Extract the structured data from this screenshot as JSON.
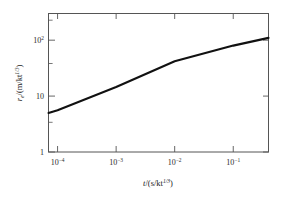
{
  "chart_data": {
    "type": "line",
    "title": "",
    "xlabel": "t/(s/kt^1/3)",
    "ylabel": "r_e/(m/kt^1/3)",
    "xscale": "log",
    "yscale": "log",
    "xlim": [
      7e-05,
      0.4
    ],
    "ylim": [
      1,
      300
    ],
    "grid": false,
    "legend": null,
    "xticks": [
      0.0001,
      0.001,
      0.01,
      0.1
    ],
    "xtick_labels": [
      "10−4",
      "10−3",
      "10−2",
      "10−1"
    ],
    "yticks": [
      1,
      10,
      100
    ],
    "ytick_labels": [
      "1",
      "10",
      "10²"
    ],
    "series": [
      {
        "name": "effective radius",
        "x": [
          7e-05,
          0.0001,
          0.001,
          0.01,
          0.1,
          0.4
        ],
        "y": [
          5.0,
          5.6,
          14.5,
          42.0,
          80.0,
          110.0
        ]
      }
    ]
  },
  "axes": {
    "x_title_parts": {
      "var": "t",
      "open": "/(s/kt",
      "exp": "1/3",
      "close": ")"
    },
    "y_title_parts": {
      "var": "r",
      "sub": "e",
      "open": "/(m/kt",
      "exp": "1/3",
      "close": ")"
    }
  },
  "xtick": {
    "t0": {
      "mantissa": "10",
      "exp": "−4"
    },
    "t1": {
      "mantissa": "10",
      "exp": "−3"
    },
    "t2": {
      "mantissa": "10",
      "exp": "−2"
    },
    "t3": {
      "mantissa": "10",
      "exp": "−1"
    }
  },
  "ytick": {
    "t0": {
      "mantissa": "1",
      "exp": ""
    },
    "t1": {
      "mantissa": "10",
      "exp": ""
    },
    "t2": {
      "mantissa": "10",
      "exp": "2"
    }
  },
  "style": {
    "curve_color": "#111111",
    "frame_color": "#555555",
    "background": "#ffffff"
  }
}
